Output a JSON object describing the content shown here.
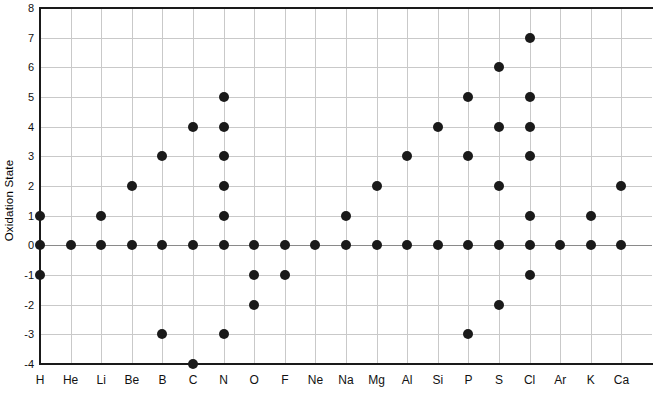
{
  "chart_data": {
    "type": "scatter",
    "title": "",
    "xlabel": "",
    "ylabel": "Oxidation State",
    "ylim": [
      -4,
      8
    ],
    "yticks": [
      8,
      7,
      6,
      5,
      4,
      3,
      2,
      1,
      0,
      -1,
      -2,
      -3,
      -4
    ],
    "ytick_labels": [
      "8",
      "7",
      "6",
      "5",
      "4",
      "3",
      "2",
      "1",
      "0",
      "-1",
      "-2",
      "-3",
      "-4"
    ],
    "grid": true,
    "legend": "none",
    "categories": [
      "H",
      "He",
      "Li",
      "Be",
      "B",
      "C",
      "N",
      "O",
      "F",
      "Ne",
      "Na",
      "Mg",
      "Al",
      "Si",
      "P",
      "S",
      "Cl",
      "Ar",
      "K",
      "Ca"
    ],
    "series": [
      {
        "name": "Oxidation states",
        "marker": "filled-circle",
        "color": "#1a1a1a",
        "points_by_category": {
          "H": [
            1,
            0,
            -1
          ],
          "He": [
            0
          ],
          "Li": [
            1,
            0
          ],
          "Be": [
            2,
            0
          ],
          "B": [
            3,
            0,
            -3
          ],
          "C": [
            4,
            0,
            -4
          ],
          "N": [
            5,
            4,
            3,
            2,
            1,
            0,
            -3
          ],
          "O": [
            0,
            -1,
            -2
          ],
          "F": [
            0,
            -1
          ],
          "Ne": [
            0
          ],
          "Na": [
            1,
            0
          ],
          "Mg": [
            2,
            0
          ],
          "Al": [
            3,
            0
          ],
          "Si": [
            4,
            0
          ],
          "P": [
            5,
            3,
            0,
            -3
          ],
          "S": [
            6,
            4,
            2,
            0,
            -2
          ],
          "Cl": [
            7,
            5,
            4,
            3,
            1,
            0,
            -1
          ],
          "Ar": [
            0
          ],
          "K": [
            1,
            0
          ],
          "Ca": [
            2,
            0
          ]
        }
      }
    ]
  },
  "colors": {
    "axis": "#1a1a1a",
    "grid": "#c9c9c9",
    "zero_line": "#8a8a8a",
    "marker": "#1a1a1a",
    "background": "#ffffff"
  }
}
